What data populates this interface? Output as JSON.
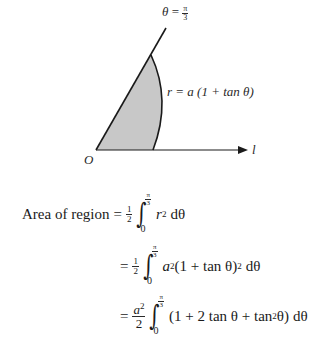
{
  "diagram": {
    "origin_label": "O",
    "axis_label": "l",
    "ray_label": {
      "lhs": "θ",
      "eq": "=",
      "num": "π",
      "den": "3"
    },
    "curve_label": "r = a (1 + tan θ)",
    "region_fill": "#c8c8c8",
    "stroke_color": "#1a1a1a"
  },
  "equations": {
    "line1": {
      "prefix": "Area of region",
      "eq": "=",
      "coef_num": "1",
      "coef_den": "2",
      "upper_num": "π",
      "upper_den": "3",
      "lower": "0",
      "integrand": "r",
      "power": "2",
      "differential": "dθ"
    },
    "line2": {
      "eq": "=",
      "coef_num": "1",
      "coef_den": "2",
      "upper_num": "π",
      "upper_den": "3",
      "lower": "0",
      "integrand_a": "a",
      "power_a": "2",
      "integrand_body": "(1 + tan θ)",
      "power_body": "2",
      "differential": "dθ"
    },
    "line3": {
      "eq": "=",
      "coef_num": "a",
      "coef_num_power": "2",
      "coef_den": "2",
      "upper_num": "π",
      "upper_den": "3",
      "lower": "0",
      "integrand_pre": "(1 + 2 tan θ + tan",
      "power": "2",
      "integrand_post": " θ)",
      "differential": "dθ"
    }
  }
}
